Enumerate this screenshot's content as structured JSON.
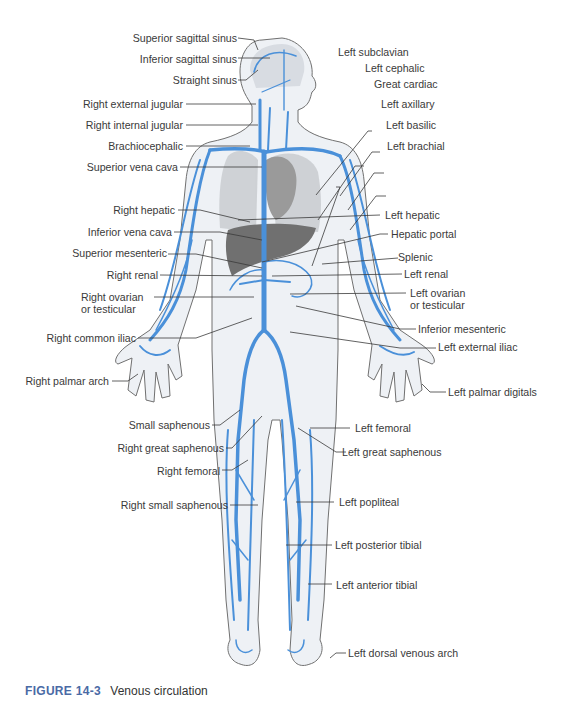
{
  "figure": {
    "number": "FIGURE 14-3",
    "title": "Venous circulation"
  },
  "colors": {
    "vein_blue": "#4a90d9",
    "skin_fill": "#eef1f5",
    "body_outline": "#707070",
    "organ_gray": "#8c8c8c",
    "liver_gray": "#6f6f6f",
    "caption_blue": "#4a6aa5",
    "leader_line": "#3a3a3a"
  },
  "labels": {
    "left_side": [
      {
        "text": "Superior sagittal sinus"
      },
      {
        "text": "Inferior sagittal sinus"
      },
      {
        "text": "Straight sinus"
      },
      {
        "text": "Right external jugular"
      },
      {
        "text": "Right internal jugular"
      },
      {
        "text": "Brachiocephalic"
      },
      {
        "text": "Superior vena cava"
      },
      {
        "text": "Right hepatic"
      },
      {
        "text": "Inferior vena cava"
      },
      {
        "text": "Superior mesenteric"
      },
      {
        "text": "Right renal"
      },
      {
        "text": "Right ovarian"
      },
      {
        "text": "or testicular"
      },
      {
        "text": "Right common iliac"
      },
      {
        "text": "Right palmar arch"
      },
      {
        "text": "Small saphenous"
      },
      {
        "text": "Right great saphenous"
      },
      {
        "text": "Right femoral"
      },
      {
        "text": "Right small saphenous"
      }
    ],
    "right_side": [
      {
        "text": "Left subclavian"
      },
      {
        "text": "Left cephalic"
      },
      {
        "text": "Great cardiac"
      },
      {
        "text": "Left axillary"
      },
      {
        "text": "Left basilic"
      },
      {
        "text": "Left brachial"
      },
      {
        "text": "Left hepatic"
      },
      {
        "text": "Hepatic portal"
      },
      {
        "text": "Splenic"
      },
      {
        "text": "Left renal"
      },
      {
        "text": "Left ovarian"
      },
      {
        "text": "or testicular"
      },
      {
        "text": "Inferior mesenteric"
      },
      {
        "text": "Left external iliac"
      },
      {
        "text": "Left palmar digitals"
      },
      {
        "text": "Left femoral"
      },
      {
        "text": "Left great saphenous"
      },
      {
        "text": "Left popliteal"
      },
      {
        "text": "Left posterior tibial"
      },
      {
        "text": "Left anterior tibial"
      },
      {
        "text": "Left dorsal venous arch"
      }
    ]
  }
}
